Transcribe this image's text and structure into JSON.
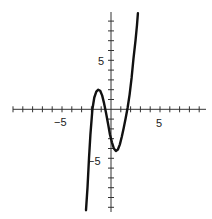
{
  "chart_data": {
    "type": "line",
    "title": "",
    "xlabel": "",
    "ylabel": "",
    "xlim": [
      -10,
      10
    ],
    "ylim": [
      -10,
      10
    ],
    "grid": false,
    "legend": null,
    "x_tick_labels": [
      {
        "value": -5,
        "label": "−5"
      },
      {
        "value": 5,
        "label": "5"
      }
    ],
    "y_tick_labels": [
      {
        "value": 5,
        "label": "5"
      },
      {
        "value": -5,
        "label": "−5"
      }
    ],
    "tick_spacing": 1,
    "series": [
      {
        "name": "f(x)",
        "color": "#111111",
        "x": [
          -2.55,
          -2.4,
          -2.25,
          -2.1,
          -1.9,
          -1.7,
          -1.5,
          -1.3,
          -1.1,
          -0.9,
          -0.7,
          -0.5,
          -0.3,
          -0.1,
          0.1,
          0.3,
          0.5,
          0.7,
          0.9,
          1.1,
          1.3,
          1.5,
          1.7,
          1.9,
          2.1,
          2.3,
          2.5,
          2.65,
          2.75
        ],
        "y": [
          -10.3,
          -8.0,
          -5.0,
          -2.6,
          0.0,
          1.2,
          1.8,
          2.0,
          1.9,
          1.4,
          0.6,
          -0.4,
          -1.5,
          -2.6,
          -3.4,
          -4.0,
          -4.25,
          -4.1,
          -3.6,
          -2.8,
          -1.9,
          -0.9,
          0.2,
          1.5,
          3.2,
          5.2,
          7.0,
          8.6,
          9.8
        ]
      }
    ]
  },
  "axes": {
    "x_label_neg5": "−5",
    "x_label_pos5": "5",
    "y_label_pos5": "5",
    "y_label_neg5": "−5"
  }
}
